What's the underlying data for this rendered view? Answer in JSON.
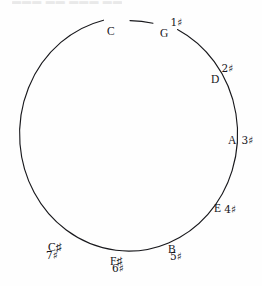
{
  "page": {
    "width": 262,
    "height": 286,
    "background": "#fefefe",
    "ink_color": "#15151a",
    "cropped_header_text": "▬▬▬ ▬▬ ▬▬▬  ▬▬"
  },
  "figure": {
    "type": "circle-of-fifths",
    "circle": {
      "center_x": 117,
      "center_y": 136,
      "radius_x": 109,
      "radius_y": 117,
      "stroke_color": "#18181c",
      "stroke_width": 1.1,
      "gaps": [
        "top-at-C",
        "top-right-at-G"
      ]
    },
    "nodes": [
      {
        "note": "C",
        "sharps": "",
        "sharp_glyph": "",
        "layout": "none"
      },
      {
        "note": "G",
        "sharps": "1",
        "sharp_glyph": "♯",
        "layout": "superscript"
      },
      {
        "note": "D",
        "sharps": "2",
        "sharp_glyph": "♯",
        "layout": "superscript"
      },
      {
        "note": "A",
        "sharps": "3",
        "sharp_glyph": "♯",
        "layout": "right"
      },
      {
        "note": "E",
        "sharps": "4",
        "sharp_glyph": "♯",
        "layout": "right-low"
      },
      {
        "note": "B",
        "sharps": "5",
        "sharp_glyph": "♯",
        "layout": "below"
      },
      {
        "note": "F♯",
        "sharps": "6",
        "sharp_glyph": "♯",
        "layout": "below"
      },
      {
        "note": "C♯",
        "sharps": "7",
        "sharp_glyph": "♯",
        "layout": "below-left"
      }
    ]
  },
  "labels": {
    "c": {
      "note": "C",
      "degree": ""
    },
    "g": {
      "note": "G",
      "degree": "1♯"
    },
    "d": {
      "note": "D",
      "degree": "2♯"
    },
    "a": {
      "note": "A",
      "degree": "3♯"
    },
    "e": {
      "note": "E",
      "degree": "4♯"
    },
    "b": {
      "note": "B",
      "degree": "5♯"
    },
    "fsharp": {
      "note": "F♯",
      "degree": "6♯"
    },
    "csharp": {
      "note": "C♯",
      "degree": "7♯"
    }
  }
}
